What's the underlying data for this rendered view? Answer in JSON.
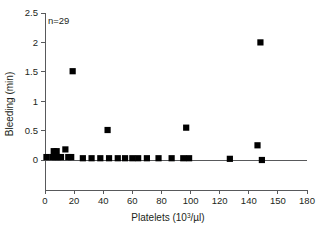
{
  "chart_data": {
    "type": "scatter",
    "title": "",
    "xlabel": "Platelets (10³/µl)",
    "xlabel_base": "Platelets (10",
    "xlabel_sup": "3",
    "xlabel_tail": "/µl)",
    "ylabel": "Bleeding (min)",
    "annotation": "n=29",
    "n": 29,
    "xlim": [
      0,
      180
    ],
    "ylim": [
      0,
      2.5
    ],
    "xticks": [
      0,
      20,
      40,
      60,
      80,
      100,
      120,
      140,
      150,
      180
    ],
    "xticklabels": [
      "0",
      "20",
      "40",
      "60",
      "80",
      "100",
      "120",
      "140",
      "150",
      "180"
    ],
    "yticks": [
      0,
      0.5,
      1,
      1.5,
      2,
      2.5
    ],
    "yticklabels": [
      "0",
      "0.5",
      "1",
      "1.5",
      "2",
      "2.5"
    ],
    "grid": false,
    "legend": "none",
    "marker": "square",
    "marker_color": "#000000",
    "points": [
      {
        "x": 1,
        "y": 0.05
      },
      {
        "x": 5,
        "y": 0.05
      },
      {
        "x": 6,
        "y": 0.15
      },
      {
        "x": 8,
        "y": 0.15
      },
      {
        "x": 7,
        "y": 0.05
      },
      {
        "x": 9,
        "y": 0.05
      },
      {
        "x": 11,
        "y": 0.05
      },
      {
        "x": 14,
        "y": 0.18
      },
      {
        "x": 16,
        "y": 0.05
      },
      {
        "x": 18,
        "y": 0.05
      },
      {
        "x": 19,
        "y": 1.51
      },
      {
        "x": 26,
        "y": 0.03
      },
      {
        "x": 32,
        "y": 0.03
      },
      {
        "x": 38,
        "y": 0.03
      },
      {
        "x": 43,
        "y": 0.51
      },
      {
        "x": 44,
        "y": 0.03
      },
      {
        "x": 50,
        "y": 0.03
      },
      {
        "x": 55,
        "y": 0.03
      },
      {
        "x": 60,
        "y": 0.03
      },
      {
        "x": 64,
        "y": 0.03
      },
      {
        "x": 70,
        "y": 0.03
      },
      {
        "x": 78,
        "y": 0.03
      },
      {
        "x": 87,
        "y": 0.03
      },
      {
        "x": 95,
        "y": 0.03
      },
      {
        "x": 97,
        "y": 0.55
      },
      {
        "x": 99,
        "y": 0.03
      },
      {
        "x": 127,
        "y": 0.02
      },
      {
        "x": 146,
        "y": 0.25
      },
      {
        "x": 148,
        "y": 2.0
      },
      {
        "x": 149,
        "y": 0.0
      }
    ]
  }
}
